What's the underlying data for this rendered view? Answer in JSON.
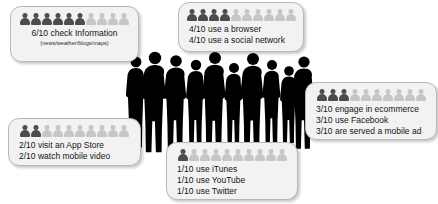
{
  "graphic": {
    "title": "Mobile user behaviour pictogram infographic",
    "icon_filled_color": "#4c4c4c",
    "icon_empty_color": "#c6c6c6",
    "card_background": "#f2f2f2",
    "card_border": "#b8b8b8",
    "silhouette_color": "#000000",
    "total_icons_per_row": 10
  },
  "cards": [
    {
      "id": "check-information",
      "filled": 6,
      "lines": [
        "6/10 check Information"
      ],
      "sub": "(news/weather/blogs/maps)"
    },
    {
      "id": "browser-social",
      "filled": 4,
      "lines": [
        "4/10 use a browser",
        "4/10 use a social network"
      ],
      "sub": ""
    },
    {
      "id": "ecommerce-facebook-ads",
      "filled": 3,
      "lines": [
        "3/10 engage in ecommerce",
        "3/10 use Facebook",
        "3/10 are served a mobile ad"
      ],
      "sub": ""
    },
    {
      "id": "appstore-video",
      "filled": 2,
      "lines": [
        "2/10 visit an App Store",
        "2/10 watch mobile video"
      ],
      "sub": ""
    },
    {
      "id": "itunes-youtube-twitter",
      "filled": 1,
      "lines": [
        "1/10 use iTunes",
        "1/10 use YouTube",
        "1/10 use Twitter"
      ],
      "sub": ""
    }
  ],
  "crowd": {
    "label": "group-of-ten-people-silhouette",
    "people_count": 10
  }
}
